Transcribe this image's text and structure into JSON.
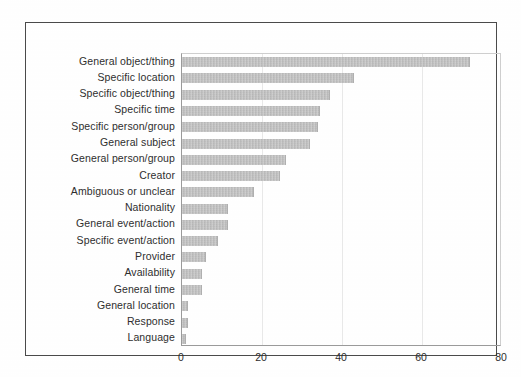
{
  "chart_data": {
    "type": "bar",
    "orientation": "horizontal",
    "title": "",
    "subtitle": "",
    "xlabel": "",
    "ylabel": "",
    "xlim": [
      0,
      80
    ],
    "ylim": null,
    "grid": true,
    "grid_axis": "x",
    "legend": false,
    "legend_position": "none",
    "xticks": [
      "0",
      "20",
      "40",
      "60",
      "80"
    ],
    "xtick_values": [
      0,
      20,
      40,
      60,
      80
    ],
    "categories": [
      "General object/thing",
      "Specific location",
      "Specific object/thing",
      "Specific time",
      "Specific person/group",
      "General subject",
      "General person/group",
      "Creator",
      "Ambiguous or unclear",
      "Nationality",
      "General event/action",
      "Specific event/action",
      "Provider",
      "Availability",
      "General time",
      "General location",
      "Response",
      "Language"
    ],
    "values": [
      72,
      43,
      37,
      34.5,
      34,
      32,
      26,
      24.5,
      18,
      11.5,
      11.5,
      9,
      6,
      5,
      5,
      1.5,
      1.5,
      1
    ],
    "bar_color": "#bcbcbc",
    "bar_edge_color": "#b0b0b0",
    "frame_color": "#4a4a4a",
    "axis_color": "#9a9a9a",
    "grid_color": "#e9e9e9",
    "text_color": "#2e2e2e"
  }
}
